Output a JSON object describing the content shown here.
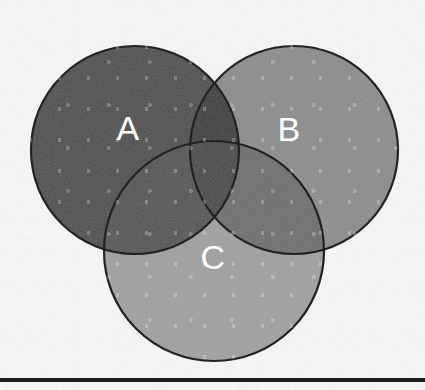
{
  "page": {
    "width": 425,
    "height": 390,
    "background_color": "#f4f3f1",
    "media": "scanned-paper"
  },
  "chart_data": {
    "type": "venn",
    "title": "",
    "subtitle": "",
    "xlabel": "",
    "ylabel": "",
    "grid": false,
    "legend_position": "none",
    "set_count": 3,
    "sets": [
      {
        "id": "A",
        "label": "A",
        "fill_color": "#4d4d4d",
        "stroke_color": "#222222",
        "label_color": "#ffffff",
        "center_x": 135,
        "center_y": 150,
        "radius": 104,
        "label_x": 128,
        "label_y": 128
      },
      {
        "id": "B",
        "label": "B",
        "fill_color": "#8c8c8c",
        "stroke_color": "#222222",
        "label_color": "#ffffff",
        "center_x": 294,
        "center_y": 150,
        "radius": 104,
        "label_x": 289,
        "label_y": 129
      },
      {
        "id": "C",
        "label": "C",
        "fill_color": "#a0a0a0",
        "stroke_color": "#222222",
        "label_color": "#ffffff",
        "center_x": 214,
        "center_y": 251,
        "radius": 110,
        "label_x": 213,
        "label_y": 257
      }
    ],
    "regions": [
      {
        "id": "A_only",
        "sets": [
          "A"
        ],
        "fill_color": "#4d4d4d"
      },
      {
        "id": "B_only",
        "sets": [
          "B"
        ],
        "fill_color": "#8c8c8c"
      },
      {
        "id": "C_only",
        "sets": [
          "C"
        ],
        "fill_color": "#a0a0a0"
      },
      {
        "id": "A_and_B",
        "sets": [
          "A",
          "B"
        ],
        "fill_color": "#3a3a3a"
      },
      {
        "id": "A_and_C",
        "sets": [
          "A",
          "C"
        ],
        "fill_color": "#545454"
      },
      {
        "id": "B_and_C",
        "sets": [
          "B",
          "C"
        ],
        "fill_color": "#6e6e6e"
      },
      {
        "id": "A_B_and_C",
        "sets": [
          "A",
          "B",
          "C"
        ],
        "fill_color": "#474747"
      }
    ],
    "annotations": [
      {
        "id": "bottom-rule",
        "kind": "horizontal-line",
        "y": 378,
        "color": "#1a1a1a",
        "thickness": 4
      }
    ]
  },
  "diagram": {
    "name": "three-set-venn-diagram",
    "labels": {
      "a": "A",
      "b": "B",
      "c": "C"
    }
  }
}
